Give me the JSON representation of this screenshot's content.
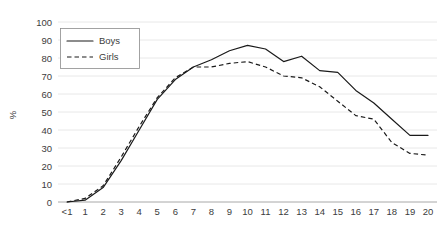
{
  "chart_data": {
    "type": "line",
    "title": "",
    "xlabel": "",
    "ylabel": "%",
    "ylim": [
      0,
      100
    ],
    "ytick_step": 10,
    "yticks": [
      0,
      10,
      20,
      30,
      40,
      50,
      60,
      70,
      80,
      90,
      100
    ],
    "grid": true,
    "legend_position": "upper-left-inside",
    "categories": [
      "<1",
      "1",
      "2",
      "3",
      "4",
      "5",
      "6",
      "7",
      "8",
      "9",
      "10",
      "11",
      "12",
      "13",
      "14",
      "15",
      "16",
      "17",
      "18",
      "19",
      "20"
    ],
    "series": [
      {
        "name": "Boys",
        "style": "solid",
        "color": "#1a1a1a",
        "values": [
          0,
          1,
          8,
          23,
          40,
          57,
          68,
          75,
          79,
          84,
          87,
          85,
          78,
          81,
          73,
          72,
          62,
          55,
          46,
          37,
          37
        ]
      },
      {
        "name": "Girls",
        "style": "dashed",
        "color": "#1a1a1a",
        "values": [
          0,
          2,
          9,
          25,
          42,
          58,
          69,
          75,
          75,
          77,
          78,
          75,
          70,
          69,
          64,
          56,
          48,
          46,
          33,
          27,
          26
        ]
      }
    ]
  },
  "axes": {
    "y_axis_title": "%",
    "y_tick_labels": [
      "100",
      "90",
      "80",
      "70",
      "60",
      "50",
      "40",
      "30",
      "20",
      "10",
      "0"
    ],
    "x_tick_labels": [
      "<1",
      "1",
      "2",
      "3",
      "4",
      "5",
      "6",
      "7",
      "8",
      "9",
      "10",
      "11",
      "12",
      "13",
      "14",
      "15",
      "16",
      "17",
      "18",
      "19",
      "20"
    ]
  },
  "legend": {
    "entries": [
      {
        "label": "Boys",
        "style": "solid"
      },
      {
        "label": "Girls",
        "style": "dashed"
      }
    ]
  },
  "colors": {
    "line": "#1a1a1a",
    "grid": "#e2e2e2",
    "axis": "#a8a8a8",
    "text": "#3c3c3c",
    "background": "#ffffff"
  }
}
